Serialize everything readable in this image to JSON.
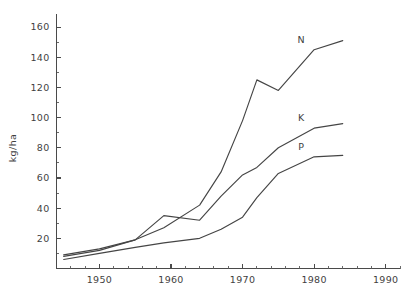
{
  "chart_data": {
    "type": "line",
    "title": "",
    "subtitle": "",
    "xlabel": "",
    "ylabel": "kg/ha",
    "xlim": [
      1944,
      1992
    ],
    "ylim": [
      0,
      166
    ],
    "grid": false,
    "legend_position": "inline-end-of-line",
    "y_ticks": [
      0,
      20,
      40,
      60,
      80,
      100,
      120,
      140,
      160
    ],
    "y_tick_labels": [
      "",
      "20",
      "40",
      "60",
      "80",
      "100",
      "120",
      "140",
      "160"
    ],
    "y_minor_step": 10,
    "x_ticks": [
      1950,
      1960,
      1970,
      1980,
      1990
    ],
    "x_tick_labels": [
      "1950",
      "1960",
      "1970",
      "1980",
      "1990"
    ],
    "x_minor_step": 2,
    "series": [
      {
        "name": "N",
        "label": "N",
        "color": "#454545",
        "x": [
          1945,
          1950,
          1955,
          1959,
          1964,
          1967,
          1970,
          1972,
          1975,
          1980,
          1984
        ],
        "values": [
          9,
          13,
          19,
          27,
          42,
          64,
          98,
          125,
          118,
          145,
          151
        ]
      },
      {
        "name": "K",
        "label": "K",
        "color": "#454545",
        "x": [
          1945,
          1950,
          1955,
          1959,
          1964,
          1967,
          1970,
          1972,
          1975,
          1980,
          1984
        ],
        "values": [
          8,
          12,
          19,
          35,
          32,
          48,
          62,
          67,
          80,
          93,
          96
        ]
      },
      {
        "name": "P",
        "label": "P",
        "color": "#454545",
        "x": [
          1945,
          1950,
          1955,
          1959,
          1964,
          1967,
          1970,
          1972,
          1975,
          1980,
          1984
        ],
        "values": [
          6,
          10,
          14,
          17,
          20,
          26,
          34,
          47,
          63,
          74,
          75
        ]
      }
    ]
  },
  "axis": {
    "y_label": "kg/ha"
  }
}
